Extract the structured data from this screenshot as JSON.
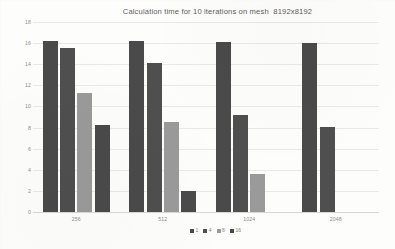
{
  "chart_data": {
    "type": "bar",
    "title": "Calculation time for 10 iterations on mesh  8192x8192",
    "xlabel": "",
    "ylabel": "",
    "categories": [
      "256",
      "512",
      "1024",
      "2048"
    ],
    "series": [
      {
        "name": "1",
        "color": "#4a4a4a",
        "values": [
          16.2,
          16.2,
          16.1,
          16.0
        ]
      },
      {
        "name": "4",
        "color": "#4f4f4f",
        "values": [
          15.5,
          14.1,
          9.2,
          8.1
        ]
      },
      {
        "name": "8",
        "color": "#9a9a9a",
        "values": [
          11.3,
          8.5,
          3.6,
          null
        ]
      },
      {
        "name": "16",
        "color": "#4a4a4a",
        "values": [
          8.2,
          2.0,
          null,
          null
        ]
      }
    ],
    "ylim": [
      0,
      18
    ],
    "ytick_step": 2,
    "yticks": [
      "0",
      "2",
      "4",
      "6",
      "8",
      "10",
      "12",
      "14",
      "16",
      "18"
    ],
    "grid": true,
    "legend_position": "bottom"
  },
  "colors": {
    "background": "#fdfdfc",
    "gridline": "#e9e9e9",
    "axis_text": "#8d8d8d",
    "title_text": "#5d5d5d",
    "bar_dark": "#4a4a4a",
    "bar_light": "#9a9a9a"
  }
}
